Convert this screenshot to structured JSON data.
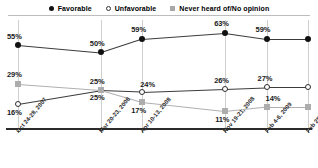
{
  "legend": {
    "items": [
      {
        "label": "Favorable",
        "icon": "filled-circle-marker",
        "color": "#111111"
      },
      {
        "label": "Unfavorable",
        "icon": "hollow-circle-marker",
        "color": "#ffffff"
      },
      {
        "label": "Never heard of/No opinion",
        "icon": "filled-square-marker",
        "color": "#a8a8a8"
      }
    ]
  },
  "chart_data": {
    "type": "line",
    "title": "",
    "xlabel": "",
    "ylabel": "",
    "ylim": [
      0,
      70
    ],
    "grid": true,
    "legend_position": "top",
    "categories": [
      "Oct 24-28, 2007",
      "Mar 20-23, 2008",
      "Apr 10-13, 2008",
      "Nov 19-21, 2008",
      "Feb 4-6, 2009",
      "Feb 25-27, 2009"
    ],
    "x_positions": [
      0,
      2,
      3,
      5,
      6,
      7
    ],
    "series": [
      {
        "name": "Favorable",
        "color": "#111111",
        "marker": "filled-circle",
        "values": [
          55,
          50,
          59,
          63,
          59,
          59
        ],
        "labels": [
          "55%",
          "50%",
          "59%",
          "63%",
          "59%",
          ""
        ]
      },
      {
        "name": "Unfavorable",
        "color": "#ffffff",
        "marker": "hollow-circle",
        "values": [
          16,
          25,
          24,
          26,
          27,
          27
        ],
        "labels": [
          "16%",
          "25%",
          "24%",
          "26%",
          "27%",
          ""
        ]
      },
      {
        "name": "Never heard of/No opinion",
        "color": "#a8a8a8",
        "marker": "filled-square",
        "values": [
          29,
          25,
          17,
          11,
          14,
          14
        ],
        "labels": [
          "29%",
          "25%",
          "17%",
          "11%",
          "14%",
          ""
        ]
      }
    ]
  }
}
